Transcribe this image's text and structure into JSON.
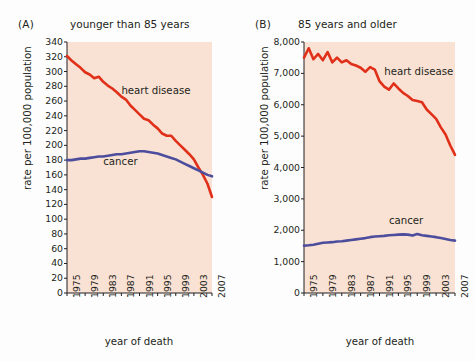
{
  "figure": {
    "background_color": "#fdfdfd",
    "plot_background_color": "#f9e2d3",
    "axis_color": "#231f20",
    "colors": {
      "heart_disease": "#e0301a",
      "cancer": "#4d4d9e"
    }
  },
  "panels": {
    "a": {
      "letter": "(A)",
      "title": "younger than 85 years"
    },
    "b": {
      "letter": "(B)",
      "title": "85 years and older"
    }
  },
  "chart_data": [
    {
      "type": "line",
      "panel": "(A)",
      "title": "younger than 85 years",
      "xlabel": "year of death",
      "ylabel": "rate per 100,000 population",
      "xlim": [
        1975,
        2007
      ],
      "ylim": [
        0,
        340
      ],
      "yticks": [
        0,
        20,
        40,
        60,
        80,
        100,
        120,
        140,
        160,
        180,
        200,
        220,
        240,
        260,
        280,
        300,
        320,
        340
      ],
      "ytick_labels": [
        "0",
        "20",
        "40",
        "60",
        "80",
        "100",
        "120",
        "140",
        "160",
        "180",
        "200",
        "220",
        "240",
        "260",
        "280",
        "300",
        "320",
        "340"
      ],
      "xticks": [
        1975,
        1979,
        1983,
        1987,
        1991,
        1995,
        1999,
        2003,
        2007
      ],
      "xtick_labels": [
        "1975",
        "1979",
        "1983",
        "1987",
        "1991",
        "1995",
        "1999",
        "2003",
        "2007"
      ],
      "grid": false,
      "legend_position": "inline-annotations",
      "x": [
        1975,
        1976,
        1977,
        1978,
        1979,
        1980,
        1981,
        1982,
        1983,
        1984,
        1985,
        1986,
        1987,
        1988,
        1989,
        1990,
        1991,
        1992,
        1993,
        1994,
        1995,
        1996,
        1997,
        1998,
        1999,
        2000,
        2001,
        2002,
        2003,
        2004,
        2005,
        2006,
        2007
      ],
      "series": [
        {
          "name": "heart disease",
          "color": "#e0301a",
          "label_x": 1987,
          "label_y": 272,
          "values": [
            321,
            315,
            310,
            305,
            299,
            296,
            291,
            293,
            286,
            281,
            277,
            272,
            266,
            262,
            254,
            248,
            242,
            236,
            234,
            228,
            223,
            216,
            213,
            213,
            206,
            200,
            194,
            188,
            181,
            170,
            160,
            148,
            130
          ]
        },
        {
          "name": "cancer",
          "color": "#4d4d9e",
          "label_x": 1983,
          "label_y": 176,
          "values": [
            180,
            180,
            181,
            182,
            182,
            183,
            184,
            185,
            185,
            186,
            187,
            188,
            188,
            189,
            190,
            191,
            192,
            192,
            191,
            190,
            189,
            187,
            185,
            183,
            181,
            178,
            175,
            172,
            169,
            166,
            163,
            160,
            158
          ]
        }
      ]
    },
    {
      "type": "line",
      "panel": "(B)",
      "title": "85 years and older",
      "xlabel": "year of death",
      "ylabel": "rate per 100,000 population",
      "xlim": [
        1975,
        2007
      ],
      "ylim": [
        0,
        8000
      ],
      "yticks": [
        0,
        1000,
        2000,
        3000,
        4000,
        5000,
        6000,
        7000,
        8000
      ],
      "ytick_labels": [
        "0",
        "1,000",
        "2,000",
        "3,000",
        "4,000",
        "5,000",
        "6,000",
        "7,000",
        "8,000"
      ],
      "xticks": [
        1975,
        1979,
        1983,
        1987,
        1991,
        1995,
        1999,
        2003,
        2007
      ],
      "xtick_labels": [
        "1975",
        "1979",
        "1983",
        "1987",
        "1991",
        "1995",
        "1999",
        "2003",
        "2007"
      ],
      "grid": false,
      "legend_position": "inline-annotations",
      "x": [
        1975,
        1976,
        1977,
        1978,
        1979,
        1980,
        1981,
        1982,
        1983,
        1984,
        1985,
        1986,
        1987,
        1988,
        1989,
        1990,
        1991,
        1992,
        1993,
        1994,
        1995,
        1996,
        1997,
        1998,
        1999,
        2000,
        2001,
        2002,
        2003,
        2004,
        2005,
        2006,
        2007
      ],
      "series": [
        {
          "name": "heart disease",
          "color": "#e0301a",
          "label_x": 1992,
          "label_y": 7000,
          "values": [
            7500,
            7800,
            7450,
            7620,
            7420,
            7680,
            7350,
            7500,
            7350,
            7420,
            7300,
            7250,
            7180,
            7050,
            7200,
            7120,
            6750,
            6580,
            6480,
            6680,
            6520,
            6380,
            6280,
            6150,
            6120,
            6080,
            5850,
            5700,
            5550,
            5280,
            5050,
            4700,
            4400
          ]
        },
        {
          "name": "cancer",
          "color": "#4d4d9e",
          "label_x": 1993,
          "label_y": 2250,
          "values": [
            1510,
            1520,
            1540,
            1570,
            1600,
            1610,
            1620,
            1640,
            1650,
            1670,
            1690,
            1710,
            1730,
            1750,
            1780,
            1800,
            1810,
            1820,
            1840,
            1850,
            1860,
            1870,
            1860,
            1830,
            1880,
            1840,
            1820,
            1800,
            1780,
            1750,
            1720,
            1690,
            1670
          ]
        }
      ]
    }
  ]
}
